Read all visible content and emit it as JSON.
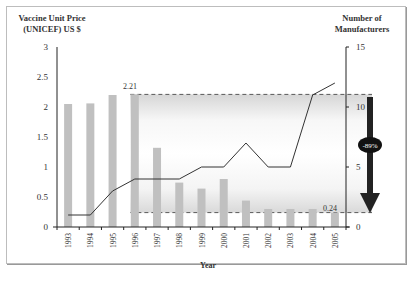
{
  "chart_data": {
    "type": "bar",
    "title": "",
    "xlabel": "Year",
    "ylabel": "Vaccine Unit Price (UNICEF) US $",
    "ylabel_line1": "Vaccine Unit Price",
    "ylabel_line2": "(UNICEF) US $",
    "y2label": "Number of Manufacturers",
    "y2label_line1": "Number of",
    "y2label_line2": "Manufacturers",
    "categories": [
      "1993",
      "1994",
      "1995",
      "1996",
      "1997",
      "1998",
      "1999",
      "2000",
      "2001",
      "2002",
      "2003",
      "2004",
      "2005"
    ],
    "series": [
      {
        "name": "Vaccine Unit Price (UNICEF) US $",
        "type": "bar",
        "axis": "left",
        "color": "#c0c0c0",
        "values": [
          2.05,
          2.06,
          2.2,
          2.21,
          1.32,
          0.74,
          0.64,
          0.8,
          0.44,
          0.3,
          0.3,
          0.3,
          0.24
        ]
      },
      {
        "name": "Number of Manufacturers",
        "type": "line",
        "axis": "right",
        "color": "#333333",
        "values": [
          1,
          1,
          3,
          4,
          4,
          4,
          5,
          5,
          7,
          5,
          5,
          11,
          12
        ]
      }
    ],
    "ylim": [
      0,
      3
    ],
    "y_ticks": [
      "0",
      "0.5",
      "1",
      "1.5",
      "2",
      "2.5",
      "3"
    ],
    "y2lim": [
      0,
      15
    ],
    "y2_ticks": [
      "0",
      "5",
      "10",
      "15"
    ],
    "annotations": {
      "high_price_label": "2.21",
      "low_price_label": "0.24",
      "decrease_label": "-89%",
      "high_price": 2.21,
      "low_price": 0.24
    },
    "grid": false,
    "legend": "none"
  }
}
